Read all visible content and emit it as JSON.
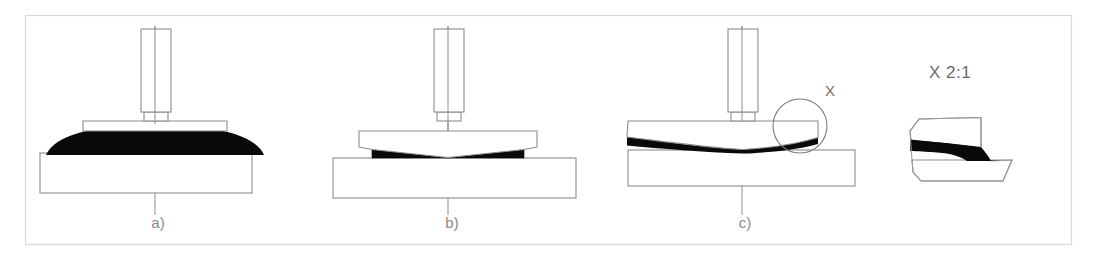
{
  "figure": {
    "background_color": "#ffffff",
    "frame": {
      "x": 25,
      "y": 15,
      "width": 1047,
      "height": 230,
      "stroke_color": "#d8d8d8"
    },
    "colors": {
      "outline": "#8c8c8c",
      "weld_fill": "#0a0a0a",
      "axis": "#8e8e8e",
      "label_text": "#8a8a8a",
      "frame": "#d8d8d8",
      "part_fill": "#ffffff"
    }
  },
  "panels": [
    {
      "id": "panel-a",
      "label": "a)",
      "label_x": 158,
      "label_y": 228,
      "centerline_x": 155,
      "description": "Upper part fully seated; thick lens-shaped black weld zone spanning full width",
      "stage": "initial contact / full squeeze-out",
      "punch": {
        "x": 141,
        "y": 29,
        "width": 30,
        "height": 83
      },
      "punch_shoulder": {
        "x": 144,
        "y": 112,
        "width": 24,
        "height": 9
      },
      "upper_plate": {
        "x": 83,
        "y": 121,
        "width": 144,
        "height": 10
      },
      "base_block": {
        "x": 40,
        "y": 153,
        "width": 212,
        "height": 40
      },
      "weld_shape": "lens",
      "axis": {
        "x": 155,
        "y_top": 26,
        "y_bottom": 215
      }
    },
    {
      "id": "panel-b",
      "label": "b)",
      "label_x": 452,
      "label_y": 228,
      "centerline_x": 448,
      "description": "Upper plate tilted into V; thin wedge-shaped black weld zones at both outer edges",
      "stage": "partial collapse / V-gap",
      "punch": {
        "x": 434,
        "y": 29,
        "width": 30,
        "height": 83
      },
      "punch_shoulder": {
        "x": 437,
        "y": 112,
        "width": 24,
        "height": 9
      },
      "upper_plate": {
        "x": 359,
        "y": 131,
        "width": 178,
        "height": 16
      },
      "base_block": {
        "x": 333,
        "y": 158,
        "width": 243,
        "height": 40
      },
      "weld_shape": "double-wedge-v",
      "axis": {
        "x": 448,
        "y_top": 26,
        "y_bottom": 215
      }
    },
    {
      "id": "panel-c",
      "label": "c)",
      "label_x": 745,
      "label_y": 228,
      "centerline_x": 742,
      "description": "Shallow dished interface with tapered black weld layer thickening toward edges; detail circle X at right edge",
      "stage": "final seating / flash at edge",
      "punch": {
        "x": 728,
        "y": 29,
        "width": 30,
        "height": 83
      },
      "punch_shoulder": {
        "x": 731,
        "y": 112,
        "width": 24,
        "height": 9
      },
      "upper_plate": {
        "x": 628,
        "y": 121,
        "width": 190,
        "height": 18
      },
      "base_block": {
        "x": 628,
        "y": 150,
        "width": 227,
        "height": 36
      },
      "weld_shape": "tapered-dish",
      "axis": {
        "x": 742,
        "y_top": 26,
        "y_bottom": 215
      },
      "detail_marker": {
        "id": "detail-circle-x",
        "label": "X",
        "circle_cx": 800,
        "circle_cy": 126,
        "circle_r": 27,
        "label_x": 830,
        "label_y": 91
      }
    }
  ],
  "detail_view": {
    "id": "detail-view-x",
    "label": "X 2:1",
    "label_x": 929,
    "label_y": 78,
    "scale": "2:1",
    "reference": "X",
    "description": "Magnified section of the edge region showing the dark weld/flash layer sweeping from the upper member down onto the lower member"
  },
  "legend_notes": {
    "weld_zone_meaning": "black filled region = weld / molten-expelled material",
    "axis_meaning": "thin vertical line = tool centre axis"
  }
}
